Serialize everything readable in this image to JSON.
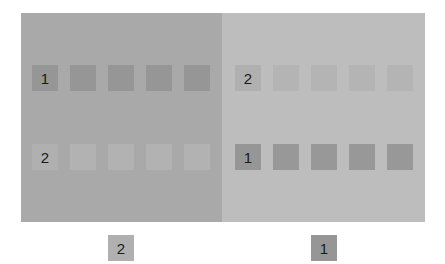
{
  "panels": {
    "left": {
      "background": "#a9a9a9",
      "rows": [
        {
          "label": "1",
          "color": "#969696",
          "label_color": "#969696"
        },
        {
          "label": "2",
          "color": "#b2b2b2",
          "label_color": "#b0b0b0"
        }
      ]
    },
    "right": {
      "background": "#bdbdbd",
      "rows": [
        {
          "label": "2",
          "color": "#b4b4b4",
          "label_color": "#b0b0b0"
        },
        {
          "label": "1",
          "color": "#989898",
          "label_color": "#969696"
        }
      ]
    }
  },
  "bottom": {
    "left": {
      "label": "2",
      "color": "#b0b0b0"
    },
    "right": {
      "label": "1",
      "color": "#969696"
    }
  }
}
